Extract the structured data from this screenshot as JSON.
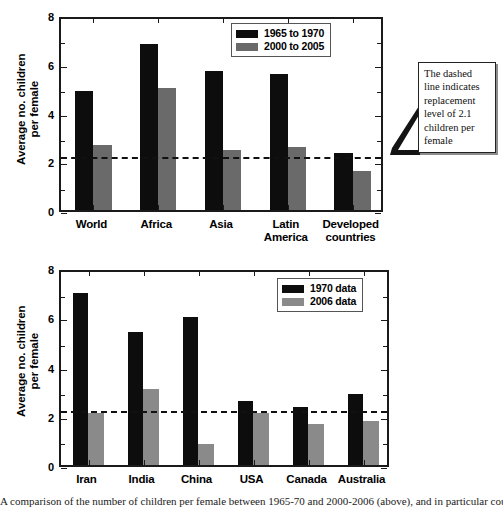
{
  "figure": {
    "background": "#ffffff",
    "caption": "A comparison of the number of children per female between 1965-70 and 2000-2006 (above), and in particular countries."
  },
  "colors": {
    "series1_top": "#0d0d0d",
    "series2_top": "#6a6a6a",
    "series1_bottom": "#0d0d0d",
    "series2_bottom": "#8a8a8a",
    "axis": "#1a1a1a",
    "dashed_line": "#111111"
  },
  "annotation": {
    "text": "The dashed\nline indicates\nreplacement\nlevel of 2.1\nchildren per\nfemale",
    "points_to": "dashed-replacement-line"
  },
  "chart_data": [
    {
      "id": "chart-regions",
      "type": "bar",
      "title": "",
      "xlabel": "",
      "ylabel": "Average no. children\nper female",
      "ylim": [
        0,
        8
      ],
      "yticks": [
        0,
        2,
        4,
        6,
        8
      ],
      "yticks_minor": [
        1,
        3,
        5,
        7
      ],
      "grid": false,
      "legend_position": "top-right",
      "categories": [
        "World",
        "Africa",
        "Asia",
        "Latin\nAmerica",
        "Developed\ncountries"
      ],
      "series": [
        {
          "name": "1965 to 1970",
          "color": "#0d0d0d",
          "values": [
            4.9,
            6.8,
            5.7,
            5.6,
            2.35
          ]
        },
        {
          "name": "2000 to 2005",
          "color": "#6a6a6a",
          "values": [
            2.65,
            5.0,
            2.45,
            2.6,
            1.6
          ]
        }
      ],
      "reference_line": {
        "value": 2.1,
        "style": "dashed",
        "label": "replacement level of 2.1 children per female"
      }
    },
    {
      "id": "chart-countries",
      "type": "bar",
      "title": "",
      "xlabel": "",
      "ylabel": "Average no. children\nper female",
      "ylim": [
        0,
        8
      ],
      "yticks": [
        0,
        2,
        4,
        6,
        8
      ],
      "yticks_minor": [
        1,
        3,
        5,
        7
      ],
      "grid": false,
      "legend_position": "top-right",
      "categories": [
        "Iran",
        "India",
        "China",
        "USA",
        "Canada",
        "Australia"
      ],
      "series": [
        {
          "name": "1970 data",
          "color": "#0d0d0d",
          "values": [
            7.0,
            5.4,
            6.0,
            2.6,
            2.35,
            2.9
          ]
        },
        {
          "name": "2006 data",
          "color": "#8a8a8a",
          "values": [
            2.1,
            3.1,
            0.85,
            2.1,
            1.65,
            1.8
          ]
        }
      ],
      "reference_line": {
        "value": 2.1,
        "style": "dashed",
        "label": "replacement level of 2.1 children per female"
      }
    }
  ]
}
